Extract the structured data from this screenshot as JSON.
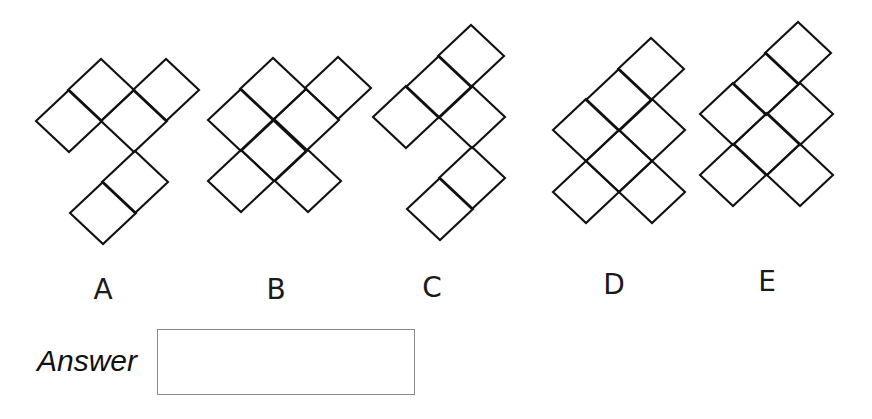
{
  "puzzle": {
    "cell": {
      "half_width": 33,
      "half_height": 31
    },
    "stroke": {
      "color": "#111111",
      "width": 2.1
    },
    "figures": [
      {
        "id": "A",
        "label": "A",
        "label_pos": {
          "x": 103,
          "y": 276
        },
        "cells": [
          [
            69,
            121
          ],
          [
            101,
            90
          ],
          [
            166,
            90
          ],
          [
            134,
            121
          ],
          [
            135,
            182
          ],
          [
            103,
            213
          ]
        ]
      },
      {
        "id": "B",
        "label": "B",
        "label_pos": {
          "x": 276,
          "y": 276
        },
        "cells": [
          [
            273,
            89
          ],
          [
            338,
            88
          ],
          [
            241,
            120
          ],
          [
            306,
            120
          ],
          [
            274,
            150
          ],
          [
            241,
            181
          ],
          [
            308,
            181
          ]
        ]
      },
      {
        "id": "C",
        "label": "C",
        "label_pos": {
          "x": 432,
          "y": 274
        },
        "cells": [
          [
            471,
            56
          ],
          [
            439,
            87
          ],
          [
            406,
            117
          ],
          [
            472,
            117
          ],
          [
            472,
            178
          ],
          [
            440,
            209
          ]
        ]
      },
      {
        "id": "D",
        "label": "D",
        "label_pos": {
          "x": 614,
          "y": 271
        },
        "cells": [
          [
            651,
            69
          ],
          [
            619,
            100
          ],
          [
            652,
            130
          ],
          [
            586,
            130
          ],
          [
            619,
            161
          ],
          [
            586,
            192
          ],
          [
            652,
            192
          ]
        ]
      },
      {
        "id": "E",
        "label": "E",
        "label_pos": {
          "x": 767,
          "y": 268
        },
        "cells": [
          [
            798,
            53
          ],
          [
            766,
            84
          ],
          [
            800,
            114
          ],
          [
            733,
            114
          ],
          [
            767,
            144
          ],
          [
            733,
            175
          ],
          [
            800,
            175
          ]
        ]
      }
    ]
  },
  "answer": {
    "label": "Answer",
    "value": "",
    "placeholder": ""
  }
}
